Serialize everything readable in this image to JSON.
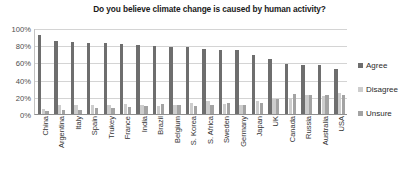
{
  "chart_data": {
    "type": "bar",
    "title": "Do you believe climate change is caused by human activity?",
    "xlabel": "",
    "ylabel": "",
    "ylim": [
      0,
      100
    ],
    "ytick_labels": [
      "100%",
      "80%",
      "60%",
      "40%",
      "20%",
      "0%"
    ],
    "ytick_values": [
      100,
      80,
      60,
      40,
      20,
      0
    ],
    "grid": true,
    "legend_position": "right",
    "categories": [
      "China",
      "Argentina",
      "Italy",
      "Spain",
      "Trukey",
      "France",
      "India",
      "Brazil",
      "Belgium",
      "S. Korea",
      "S. Africa",
      "Sweden",
      "Germany",
      "Japan",
      "UK",
      "Canada",
      "Russia",
      "Australia",
      "USA"
    ],
    "series": [
      {
        "name": "Agree",
        "color": "#6e6e6e",
        "values": [
          92,
          85,
          84,
          83,
          82,
          81,
          80,
          79,
          78,
          78,
          76,
          75,
          74,
          69,
          64,
          58,
          57,
          57,
          52
        ]
      },
      {
        "name": "Disagree",
        "color": "#cdcdcd",
        "values": [
          6,
          10,
          11,
          10,
          11,
          12,
          10,
          9,
          11,
          13,
          15,
          12,
          10,
          15,
          18,
          19,
          22,
          21,
          25
        ]
      },
      {
        "name": "Unsure",
        "color": "#a3a3a3",
        "values": [
          3,
          5,
          5,
          7,
          7,
          8,
          9,
          12,
          11,
          9,
          10,
          13,
          11,
          13,
          18,
          23,
          22,
          22,
          22
        ]
      }
    ]
  }
}
